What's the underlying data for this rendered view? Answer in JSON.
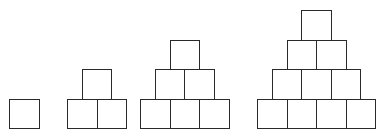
{
  "diagram": {
    "square_size": 29.5,
    "stroke_color": "#2a2a2a",
    "background": "#ffffff",
    "baseline_y": 128,
    "figures": [
      {
        "id": "figure-1",
        "rows": 1,
        "left": 9,
        "row_counts": [
          1
        ],
        "total_squares": 1
      },
      {
        "id": "figure-2",
        "rows": 2,
        "left": 67,
        "row_counts": [
          2,
          1
        ],
        "total_squares": 3
      },
      {
        "id": "figure-3",
        "rows": 3,
        "left": 140,
        "row_counts": [
          3,
          2,
          1
        ],
        "total_squares": 6
      },
      {
        "id": "figure-4",
        "rows": 4,
        "left": 257,
        "row_counts": [
          4,
          3,
          2,
          1
        ],
        "total_squares": 10
      }
    ]
  }
}
